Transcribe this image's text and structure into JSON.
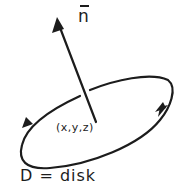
{
  "diagram": {
    "normal_vector_label": "n",
    "point_label": "(x,y,z)",
    "caption": "D = disk",
    "ink_color": "#1c1c1c",
    "background_color": "#ffffff"
  }
}
